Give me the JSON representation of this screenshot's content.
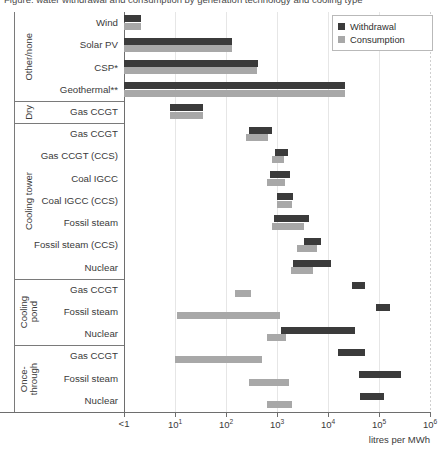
{
  "axis": {
    "title": "litres per MWh",
    "ticks": [
      {
        "label": "<1",
        "exp": null,
        "pos": 0
      },
      {
        "label": "10",
        "exp": "1",
        "pos": 1
      },
      {
        "label": "10",
        "exp": "2",
        "pos": 2
      },
      {
        "label": "10",
        "exp": "3",
        "pos": 3
      },
      {
        "label": "10",
        "exp": "4",
        "pos": 4
      },
      {
        "label": "10",
        "exp": "5",
        "pos": 5
      },
      {
        "label": "10",
        "exp": "6",
        "pos": 6
      }
    ]
  },
  "legend": {
    "items": [
      {
        "label": "Withdrawal",
        "kind": "w",
        "color": "#3b3b3b"
      },
      {
        "label": "Consumption",
        "kind": "c",
        "color": "#a8a8a8"
      }
    ]
  },
  "clipped_caption": "Figure: water withdrawal and consumption by generation technology and cooling type",
  "chart_data": {
    "type": "bar",
    "orientation": "horizontal-range",
    "title": "",
    "xlabel": "litres per MWh",
    "ylabel": "",
    "xscale": "log10",
    "xlim": [
      0,
      6
    ],
    "xticklabels": [
      "<1",
      "10^1",
      "10^2",
      "10^3",
      "10^4",
      "10^5",
      "10^6"
    ],
    "grid": "vertical",
    "legend_position": "top-right",
    "legend": [
      "Withdrawal",
      "Consumption"
    ],
    "series": [
      {
        "name": "Withdrawal",
        "color": "#3b3b3b"
      },
      {
        "name": "Consumption",
        "color": "#a8a8a8"
      }
    ],
    "groups": [
      {
        "group": "Other/none",
        "rows": [
          {
            "label": "Wind",
            "withdrawal": [
              0.0,
              0.33
            ],
            "consumption": [
              0.0,
              0.33
            ]
          },
          {
            "label": "Solar PV",
            "withdrawal": [
              0.0,
              2.12
            ],
            "consumption": [
              0.0,
              2.12
            ]
          },
          {
            "label": "CSP*",
            "withdrawal": [
              0.0,
              2.62
            ],
            "consumption": [
              0.0,
              2.6
            ]
          },
          {
            "label": "Geothermal**",
            "withdrawal": [
              0.0,
              4.33
            ],
            "consumption": [
              0.0,
              4.33
            ]
          }
        ]
      },
      {
        "group": "Dry",
        "rows": [
          {
            "label": "Gas CCGT",
            "withdrawal": [
              0.9,
              1.55
            ],
            "consumption": [
              0.9,
              1.55
            ]
          }
        ]
      },
      {
        "group": "Cooling tower",
        "rows": [
          {
            "label": "Gas CCGT",
            "withdrawal": [
              2.46,
              2.9
            ],
            "consumption": [
              2.4,
              2.82
            ]
          },
          {
            "label": "Gas CCGT (CCS)",
            "withdrawal": [
              2.96,
              3.22
            ],
            "consumption": [
              2.9,
              3.14
            ]
          },
          {
            "label": "Coal IGCC",
            "withdrawal": [
              2.86,
              3.26
            ],
            "consumption": [
              2.8,
              3.16
            ]
          },
          {
            "label": "Coal IGCC (CCS)",
            "withdrawal": [
              3.0,
              3.32
            ],
            "consumption": [
              3.0,
              3.3
            ]
          },
          {
            "label": "Fossil steam",
            "withdrawal": [
              2.94,
              3.62
            ],
            "consumption": [
              2.9,
              3.52
            ]
          },
          {
            "label": "Fossil steam (CCS)",
            "withdrawal": [
              3.52,
              3.86
            ],
            "consumption": [
              3.4,
              3.78
            ]
          },
          {
            "label": "Nuclear",
            "withdrawal": [
              3.32,
              4.06
            ],
            "consumption": [
              3.28,
              3.7
            ]
          }
        ]
      },
      {
        "group": "Cooling\npond",
        "rows": [
          {
            "label": "Gas CCGT",
            "withdrawal": [
              4.48,
              4.72
            ],
            "consumption": [
              2.18,
              2.5
            ]
          },
          {
            "label": "Fossil steam",
            "withdrawal": [
              4.94,
              5.22
            ],
            "consumption": [
              1.04,
              3.06
            ]
          },
          {
            "label": "Nuclear",
            "withdrawal": [
              3.08,
              4.52
            ],
            "consumption": [
              2.8,
              3.18
            ]
          }
        ]
      },
      {
        "group": "Once-\nthrough",
        "rows": [
          {
            "label": "Gas CCGT",
            "withdrawal": [
              4.2,
              4.72
            ],
            "consumption": [
              1.0,
              2.7
            ]
          },
          {
            "label": "Fossil steam",
            "withdrawal": [
              4.6,
              5.44
            ],
            "consumption": [
              2.46,
              3.24
            ]
          },
          {
            "label": "Nuclear",
            "withdrawal": [
              4.62,
              5.1
            ],
            "consumption": [
              2.8,
              3.3
            ]
          }
        ]
      }
    ]
  }
}
